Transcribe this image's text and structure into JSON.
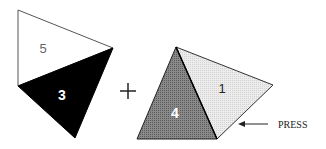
{
  "diagram": {
    "left_shape": {
      "top_face_label": "5",
      "bottom_face_label": "3",
      "top_face_color": "#ffffff",
      "bottom_face_color": "#000000"
    },
    "operator": "+",
    "right_shape": {
      "left_face_label": "4",
      "right_face_label": "1",
      "left_face_color": "#7a7a7a",
      "right_face_color": "#e6e6e6"
    },
    "annotation": {
      "label": "PRESS",
      "arrow_direction": "left"
    }
  }
}
